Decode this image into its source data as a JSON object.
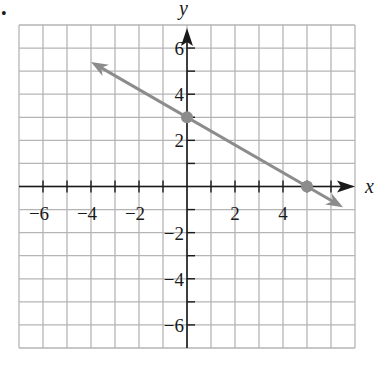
{
  "chart_data": {
    "type": "line",
    "title": "",
    "xlabel": "x",
    "ylabel": "y",
    "xlim": [
      -7,
      7
    ],
    "ylim": [
      -7,
      7
    ],
    "grid": true,
    "grid_step": 1,
    "x_tick_labels": [
      "−6",
      "−4",
      "−2",
      "2",
      "4"
    ],
    "x_tick_values": [
      -6,
      -4,
      -2,
      2,
      4
    ],
    "y_tick_labels": [
      "6",
      "4",
      "2",
      "−2",
      "−4",
      "−6"
    ],
    "y_tick_values": [
      6,
      4,
      2,
      -2,
      -4,
      -6
    ],
    "series": [
      {
        "name": "line",
        "equation": "y = -3/5 x + 3",
        "slope": -0.6,
        "intercept": 3,
        "x": [
          -4,
          6.5
        ],
        "y": [
          5.4,
          -0.9
        ],
        "arrows_both_ends": true,
        "color": "#8c8c8c"
      }
    ],
    "points": [
      {
        "x": 0,
        "y": 3,
        "label": "y-intercept"
      },
      {
        "x": 5,
        "y": 0,
        "label": "x-intercept"
      }
    ]
  },
  "labels": {
    "x_axis": "x",
    "y_axis": "y",
    "bullet": "•"
  },
  "colors": {
    "grid": "#b5b5b5",
    "axis": "#1a1a1a",
    "line": "#8c8c8c",
    "point": "#8c8c8c"
  }
}
